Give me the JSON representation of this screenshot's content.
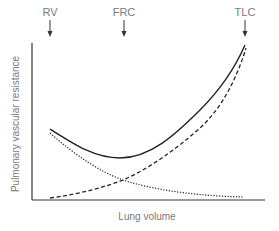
{
  "diagram": {
    "title": "",
    "markers": [
      {
        "label": "RV",
        "x": 50
      },
      {
        "label": "FRC",
        "x": 124
      },
      {
        "label": "TLC",
        "x": 245
      }
    ],
    "xlabel": "Lung volume",
    "ylabel": "Pulmonary vascular resistance",
    "curves": [
      {
        "name": "total",
        "style": "solid",
        "description": "Total pulmonary vascular resistance (U-shaped, minimum near FRC)"
      },
      {
        "name": "alveolar",
        "style": "dashed",
        "description": "Alveolar vessel resistance (rises with lung volume)"
      },
      {
        "name": "extra-alveolar",
        "style": "dotted",
        "description": "Extra-alveolar vessel resistance (falls with lung volume)"
      }
    ],
    "colors": {
      "axis": "#333333",
      "curve": "#222222",
      "text": "#7a7a7a"
    }
  }
}
